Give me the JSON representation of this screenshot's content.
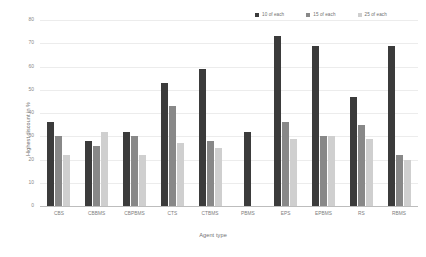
{
  "chart_data": {
    "type": "bar",
    "title": "",
    "xlabel": "Agent type",
    "ylabel": "Highest discount in %",
    "ylim": [
      0,
      80
    ],
    "yticks": [
      0,
      10,
      20,
      30,
      40,
      50,
      60,
      70,
      80
    ],
    "grid": true,
    "legend_position": "top-right",
    "categories": [
      "CBS",
      "CBBMS",
      "CBPBMS",
      "CTS",
      "CTBMS",
      "PBMS",
      "EPS",
      "EPBMS",
      "RS",
      "RBMS"
    ],
    "series": [
      {
        "name": "10 of each",
        "color": "#3b3b3b",
        "values": [
          36,
          28,
          32,
          53,
          59,
          32,
          73,
          69,
          47,
          69
        ]
      },
      {
        "name": "15 of each",
        "color": "#888888",
        "values": [
          30,
          26,
          30,
          43,
          28,
          null,
          36,
          30,
          35,
          22
        ]
      },
      {
        "name": "25 of each",
        "color": "#cfcfcf",
        "values": [
          22,
          32,
          22,
          27,
          25,
          null,
          29,
          30,
          29,
          20
        ]
      }
    ]
  },
  "legend": {
    "items": [
      {
        "label": "10 of each",
        "color": "#3b3b3b"
      },
      {
        "label": "15 of each",
        "color": "#888888"
      },
      {
        "label": "25 of each",
        "color": "#cfcfcf"
      }
    ]
  },
  "axes": {
    "y_title": "Highest discount in %",
    "x_title": "Agent type",
    "y_tick_labels": [
      "80",
      "70",
      "60",
      "50",
      "40",
      "30",
      "20",
      "10",
      "0"
    ]
  }
}
